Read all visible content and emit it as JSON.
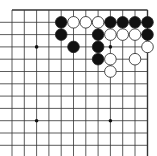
{
  "board": {
    "description": "Go board, top-right corner fragment",
    "grid": {
      "x_lines": [
        12,
        24.3,
        36.6,
        48.9,
        61.2,
        73.5,
        85.8,
        98.1,
        110.4,
        122.7,
        135,
        147.5
      ],
      "y_lines": [
        10,
        22.3,
        34.6,
        46.9,
        59.2,
        71.5,
        83.8,
        96.1,
        108.4,
        120.7,
        133,
        145.3
      ],
      "line_color": "#333333",
      "edge_top_y": 10,
      "edge_right_x": 147.5
    },
    "star_points": [
      [
        2,
        3
      ],
      [
        8,
        3
      ],
      [
        2,
        9
      ],
      [
        8,
        9
      ]
    ],
    "stones": [
      {
        "color": "black",
        "col": 4,
        "row": 1
      },
      {
        "color": "white",
        "col": 5,
        "row": 1
      },
      {
        "color": "white",
        "col": 6,
        "row": 1
      },
      {
        "color": "white",
        "col": 7,
        "row": 1
      },
      {
        "color": "black",
        "col": 8,
        "row": 1
      },
      {
        "color": "black",
        "col": 9,
        "row": 1
      },
      {
        "color": "black",
        "col": 10,
        "row": 1
      },
      {
        "color": "black",
        "col": 11,
        "row": 1
      },
      {
        "color": "black",
        "col": 4,
        "row": 2
      },
      {
        "color": "black",
        "col": 7,
        "row": 2
      },
      {
        "color": "white",
        "col": 8,
        "row": 2
      },
      {
        "color": "white",
        "col": 9,
        "row": 2
      },
      {
        "color": "white",
        "col": 10,
        "row": 2
      },
      {
        "color": "black",
        "col": 11,
        "row": 2
      },
      {
        "color": "black",
        "col": 5,
        "row": 3
      },
      {
        "color": "black",
        "col": 7,
        "row": 3
      },
      {
        "color": "white",
        "col": 11,
        "row": 3
      },
      {
        "color": "black",
        "col": 7,
        "row": 4
      },
      {
        "color": "white",
        "col": 8,
        "row": 4
      },
      {
        "color": "white",
        "col": 10,
        "row": 4
      },
      {
        "color": "white",
        "col": 8,
        "row": 5
      }
    ],
    "colors": {
      "black_stone": "#111111",
      "white_stone": "#ffffff",
      "stone_outline": "#222222"
    }
  }
}
